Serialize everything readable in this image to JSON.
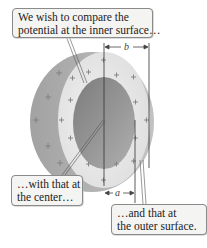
{
  "figure": {
    "callouts": [
      {
        "id": "inner",
        "line1": "We wish to compare the",
        "line2": "potential at the inner surface…"
      },
      {
        "id": "center",
        "line1": "…with that at",
        "line2": "the center…"
      },
      {
        "id": "outer",
        "line1": "…and that at",
        "line2": "the outer surface."
      }
    ],
    "dimensions": {
      "outer_radius_label": "b",
      "inner_radius_label": "a"
    },
    "charge_symbol": "+",
    "colors": {
      "outer_shell_side": "#a9a9a9",
      "shell_face": "#e6e6e6",
      "inner_cavity": "#8e8e8e",
      "plus": "#7a7a7a",
      "dim_line": "#444444"
    }
  }
}
